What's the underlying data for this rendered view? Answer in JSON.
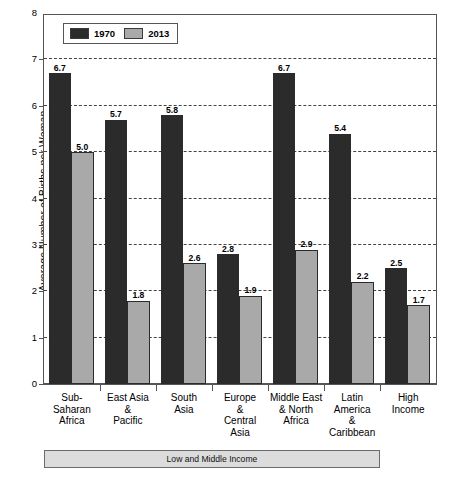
{
  "chart_data": {
    "type": "bar",
    "title": "",
    "xlabel": "",
    "ylabel": "Average Number of Births per Woman",
    "ylim": [
      0,
      8
    ],
    "yticks": [
      0,
      1,
      2,
      3,
      4,
      5,
      6,
      7,
      8
    ],
    "ytick_labels": [
      "0",
      "1",
      "2",
      "3",
      "4",
      "5",
      "6",
      "7",
      "8"
    ],
    "grid": "horizontal-dashed",
    "legend_position": "top-left-inside",
    "categories": [
      "Sub-\nSaharan\nAfrica",
      "East Asia\n&\nPacific",
      "South\nAsia",
      "Europe\n&\nCentral\nAsia",
      "Middle East\n& North\nAfrica",
      "Latin\nAmerica\n&\nCaribbean",
      "High\nIncome"
    ],
    "series": [
      {
        "name": "1970",
        "color": "#2b2b2b",
        "values": [
          6.7,
          5.7,
          5.8,
          2.8,
          6.7,
          5.4,
          2.5
        ],
        "value_labels": [
          "6.7",
          "5.7",
          "5.8",
          "2.8",
          "6.7",
          "5.4",
          "2.5"
        ]
      },
      {
        "name": "2013",
        "color": "#a9a9a9",
        "values": [
          5.0,
          1.8,
          2.6,
          1.9,
          2.9,
          2.2,
          1.7
        ],
        "value_labels": [
          "5.0",
          "1.8",
          "2.6",
          "1.9",
          "2.9",
          "2.2",
          "1.7"
        ]
      }
    ],
    "annotations": [
      {
        "name": "group-bracket",
        "text": "Low and Middle Income",
        "spans_categories": [
          0,
          5
        ]
      }
    ]
  },
  "legend": {
    "items": [
      {
        "label": "1970",
        "color": "#2b2b2b"
      },
      {
        "label": "2013",
        "color": "#a9a9a9"
      }
    ]
  },
  "axis": {
    "y_title": "Average Number of Births per Woman"
  },
  "bracket": {
    "label": "Low and Middle Income"
  }
}
